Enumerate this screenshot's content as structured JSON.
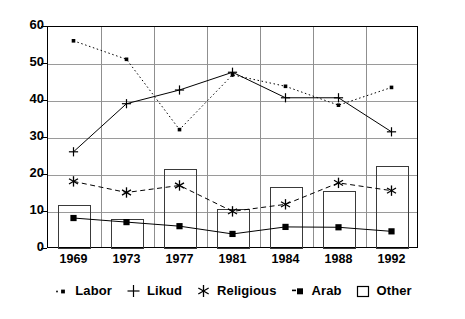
{
  "chart_data": {
    "type": "line",
    "title": "",
    "subtitle": "",
    "xlabel": "",
    "ylabel": "",
    "categories": [
      "1969",
      "1973",
      "1977",
      "1981",
      "1984",
      "1988",
      "1992"
    ],
    "ylim": [
      0,
      60
    ],
    "yticks": [
      0,
      10,
      20,
      30,
      40,
      50,
      60
    ],
    "grid": true,
    "legend_position": "bottom",
    "series": [
      {
        "name": "Labor",
        "style": "dotted",
        "marker": "square",
        "values": [
          56.0,
          51.0,
          32.0,
          46.8,
          43.7,
          38.6,
          43.4
        ]
      },
      {
        "name": "Likud",
        "style": "solid",
        "marker": "plus",
        "values": [
          26.0,
          39.0,
          42.7,
          47.5,
          40.6,
          40.6,
          31.4
        ]
      },
      {
        "name": "Religious",
        "style": "dashed",
        "marker": "asterisk",
        "values": [
          18.0,
          15.0,
          16.9,
          9.9,
          11.8,
          17.6,
          15.5
        ]
      },
      {
        "name": "Arab",
        "style": "solid",
        "marker": "filled-square",
        "values": [
          8.1,
          7.0,
          5.9,
          3.8,
          5.7,
          5.6,
          4.5
        ]
      },
      {
        "name": "Other",
        "style": "bar",
        "marker": "open-rect",
        "values": [
          12.0,
          8.0,
          21.7,
          10.7,
          16.7,
          15.6,
          22.4
        ]
      }
    ]
  },
  "legend": {
    "items": [
      {
        "label": "Labor",
        "marker": "dotted-square-marker"
      },
      {
        "label": "Likud",
        "marker": "plus-marker"
      },
      {
        "label": "Religious",
        "marker": "asterisk-marker"
      },
      {
        "label": "Arab",
        "marker": "filled-square-marker"
      },
      {
        "label": "Other",
        "marker": "open-rect-marker"
      }
    ]
  },
  "colors": {
    "line": "#000000",
    "grid": "#9a9a9a",
    "frame": "#000000",
    "bar_stroke": "#3a3a3a",
    "background": "#ffffff"
  }
}
